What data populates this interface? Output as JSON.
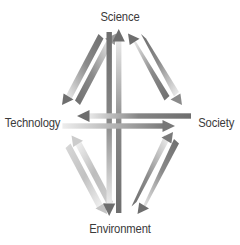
{
  "diagram": {
    "nodes": {
      "top": "Science",
      "left": "Technology",
      "right": "Society",
      "bottom": "Environment"
    },
    "colors": {
      "text": "#3b3b3b",
      "arrow_dark": "#6b6b6b",
      "arrow_mid": "#8e8e8e",
      "arrow_light": "#c9c9c9",
      "arrow_faint": "#e8e8e8",
      "background": "#ffffff"
    },
    "arrows": [
      {
        "name": "science-to-technology",
        "from": "Science",
        "to": "Technology",
        "group": "upper-left",
        "tone": "dark"
      },
      {
        "name": "technology-to-science",
        "from": "Technology",
        "to": "Science",
        "group": "upper-left",
        "tone": "dark"
      },
      {
        "name": "science-to-society",
        "from": "Science",
        "to": "Society",
        "group": "upper-right",
        "tone": "dark"
      },
      {
        "name": "society-to-science",
        "from": "Society",
        "to": "Science",
        "group": "upper-right",
        "tone": "dark"
      },
      {
        "name": "technology-to-environment",
        "from": "Technology",
        "to": "Environment",
        "group": "lower-left",
        "tone": "light"
      },
      {
        "name": "environment-to-technology",
        "from": "Environment",
        "to": "Technology",
        "group": "lower-left",
        "tone": "light"
      },
      {
        "name": "society-to-environment",
        "from": "Society",
        "to": "Environment",
        "group": "lower-right",
        "tone": "dark"
      },
      {
        "name": "environment-to-society",
        "from": "Environment",
        "to": "Society",
        "group": "lower-right",
        "tone": "dark"
      },
      {
        "name": "environment-to-science",
        "from": "Environment",
        "to": "Science",
        "group": "vertical",
        "tone": "dark"
      },
      {
        "name": "science-to-environment",
        "from": "Science",
        "to": "Environment",
        "group": "vertical",
        "tone": "dark"
      },
      {
        "name": "society-to-technology",
        "from": "Society",
        "to": "Technology",
        "group": "horizontal",
        "tone": "dark"
      },
      {
        "name": "technology-to-society",
        "from": "Technology",
        "to": "Society",
        "group": "horizontal",
        "tone": "light"
      }
    ]
  }
}
